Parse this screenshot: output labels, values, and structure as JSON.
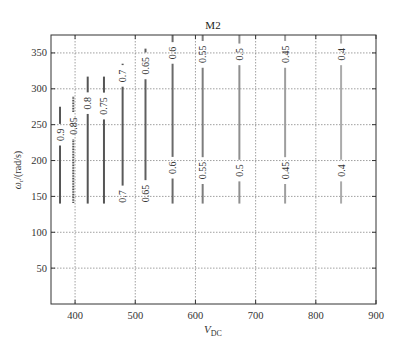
{
  "chart_data": {
    "type": "line",
    "subtype": "contour",
    "title": "M2",
    "xlabel": "V_DC",
    "xlabel_main": "V",
    "xlabel_sub": "DC",
    "ylabel": "ω_r/(rad/s)",
    "ylabel_main": "ω",
    "ylabel_sub": "r",
    "ylabel_rest": "/(rad/s)",
    "xlim": [
      360,
      900
    ],
    "ylim": [
      0,
      375
    ],
    "xticks": [
      400,
      500,
      600,
      700,
      800,
      900
    ],
    "yticks": [
      50,
      100,
      150,
      200,
      250,
      300,
      350
    ],
    "grid": true,
    "legend": "none",
    "series": [
      {
        "name": "0.9",
        "level": 0.9,
        "x": 375,
        "y_range": [
          140,
          275
        ],
        "color": "#555555",
        "label_y": [
          236
        ]
      },
      {
        "name": "0.85",
        "level": 0.85,
        "x": 397,
        "y_range": [
          140,
          289
        ],
        "color": "#555555",
        "label_y": [
          248
        ],
        "dashed": true
      },
      {
        "name": "0.8",
        "level": 0.8,
        "x": 421,
        "y_range": [
          140,
          317
        ],
        "color": "#555555",
        "label_y": [
          280
        ]
      },
      {
        "name": "0.75",
        "level": 0.75,
        "x": 448,
        "y_range": [
          140,
          317
        ],
        "color": "#555555",
        "label_y": [
          276
        ]
      },
      {
        "name": "0.7",
        "level": 0.7,
        "x": 479,
        "y_range": [
          140,
          335
        ],
        "color": "#5a5a5a",
        "label_y": [
          318,
          150
        ]
      },
      {
        "name": "0.65",
        "level": 0.65,
        "x": 517,
        "y_range": [
          140,
          356
        ],
        "color": "#5f5f5f",
        "label_y": [
          332,
          154
        ]
      },
      {
        "name": "0.6",
        "level": 0.6,
        "x": 562,
        "y_range": [
          140,
          375
        ],
        "color": "#6a6a6a",
        "label_y": [
          350,
          190
        ]
      },
      {
        "name": "0.55",
        "level": 0.55,
        "x": 612,
        "y_range": [
          140,
          375
        ],
        "color": "#7d7d7d",
        "label_y": [
          348,
          186
        ]
      },
      {
        "name": "0.5",
        "level": 0.5,
        "x": 673,
        "y_range": [
          140,
          375
        ],
        "color": "#8f8f8f",
        "label_y": [
          348,
          186
        ]
      },
      {
        "name": "0.45",
        "level": 0.45,
        "x": 749,
        "y_range": [
          140,
          375
        ],
        "color": "#9e9e9e",
        "label_y": [
          348,
          186
        ]
      },
      {
        "name": "0.4",
        "level": 0.4,
        "x": 842,
        "y_range": [
          140,
          375
        ],
        "color": "#ababab",
        "label_y": [
          348,
          186
        ]
      }
    ]
  }
}
